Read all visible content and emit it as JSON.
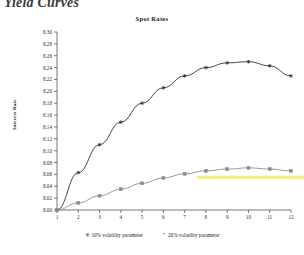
{
  "page": {
    "heading": "Yield Curves"
  },
  "chart_data": {
    "type": "line",
    "title": "Spot Rates",
    "xlabel": "",
    "ylabel": "Interest Rate",
    "grid": false,
    "legend_position": "bottom",
    "x": [
      1,
      2,
      3,
      4,
      5,
      6,
      7,
      8,
      9,
      10,
      11,
      12
    ],
    "xlim": [
      1,
      12
    ],
    "ylim": [
      8.0,
      8.3
    ],
    "ytick_labels": [
      "8.30",
      "8.28",
      "8.26",
      "8.24",
      "8.22",
      "8.20",
      "8.18",
      "8.16",
      "8.14",
      "8.12",
      "8.10",
      "8.08",
      "8.06",
      "8.04",
      "8.02",
      "8.00"
    ],
    "ytick_values": [
      8.3,
      8.28,
      8.26,
      8.24,
      8.22,
      8.2,
      8.18,
      8.16,
      8.14,
      8.12,
      8.1,
      8.08,
      8.06,
      8.04,
      8.02,
      8.0
    ],
    "xtick_labels": [
      "1",
      "2",
      "3",
      "4",
      "5",
      "6",
      "7",
      "8",
      "9",
      "10",
      "11",
      "12"
    ],
    "series": [
      {
        "name": "10% volatility parameter",
        "marker": "asterisk",
        "marker_glyph": "✳",
        "color": "#303030",
        "values": [
          8.0,
          8.063,
          8.11,
          8.148,
          8.18,
          8.206,
          8.226,
          8.24,
          8.248,
          8.25,
          8.243,
          8.226
        ]
      },
      {
        "name": "20% volatility parameter",
        "marker": "plus",
        "marker_glyph": "+",
        "color": "#8c8c8c",
        "values": [
          8.0,
          8.012,
          8.024,
          8.035,
          8.045,
          8.054,
          8.061,
          8.066,
          8.069,
          8.071,
          8.069,
          8.066
        ]
      }
    ],
    "annotations": [
      {
        "type": "highlight-line",
        "color": "#f2ef7a",
        "y": 8.055,
        "x_start": 7.6,
        "x_end": 12.6
      }
    ]
  }
}
